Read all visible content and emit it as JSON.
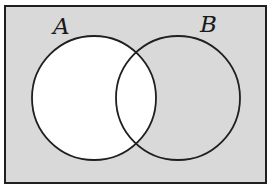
{
  "diagram": {
    "type": "venn",
    "colors": {
      "page_background": "#ffffff",
      "shaded_region": "#d9d9d9",
      "unshaded_region": "#ffffff",
      "outline": "#1f1f1f"
    },
    "universe": {
      "x": 5,
      "y": 6,
      "width": 261,
      "height": 177
    },
    "sets": [
      {
        "label": "A",
        "cx": 94,
        "cy": 98,
        "r": 62,
        "label_x": 53,
        "label_y": 34,
        "shaded": false
      },
      {
        "label": "B",
        "cx": 178,
        "cy": 98,
        "r": 62,
        "label_x": 200,
        "label_y": 32,
        "shaded": true
      }
    ],
    "shaded_regions": [
      "U − A"
    ],
    "unshaded_regions": [
      "A"
    ]
  }
}
